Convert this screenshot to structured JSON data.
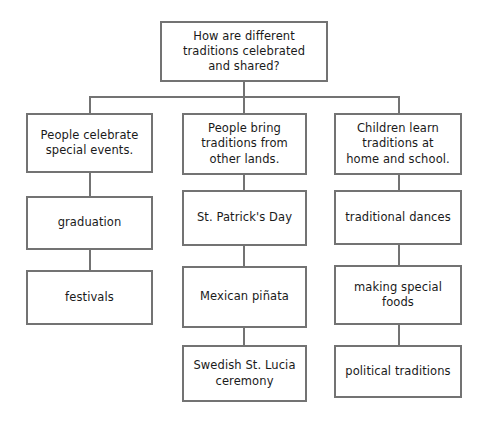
{
  "diagram": {
    "type": "tree-flowchart",
    "title_node": {
      "id": "root",
      "text": "How are different\ntraditions celebrated\nand shared?"
    },
    "branches": [
      {
        "id": "branch-1",
        "heading": "People celebrate\nspecial events.",
        "items": [
          "graduation",
          "festivals"
        ]
      },
      {
        "id": "branch-2",
        "heading": "People bring\ntraditions from\nother lands.",
        "items": [
          "St. Patrick's Day",
          "Mexican piñata",
          "Swedish St. Lucia\nceremony"
        ]
      },
      {
        "id": "branch-3",
        "heading": "Children learn\ntraditions at\nhome and school.",
        "items": [
          "traditional dances",
          "making special\nfoods",
          "political traditions"
        ]
      }
    ],
    "style": {
      "border_color": "#737373",
      "text_color": "#1a1a1a",
      "background": "#ffffff"
    }
  }
}
